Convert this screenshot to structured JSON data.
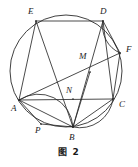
{
  "figure": {
    "caption": "图 2",
    "stroke_color": "#2b2b2b",
    "label_color": "#1c1c1c",
    "background_color": "#ffffff",
    "circle": {
      "cx": 66,
      "cy": 71,
      "r": 56
    },
    "points": [
      {
        "id": "E",
        "label": "E",
        "x": 36,
        "y": 21,
        "label_x": 28,
        "label_y": 7
      },
      {
        "id": "D",
        "label": "D",
        "x": 103,
        "y": 21,
        "label_x": 100,
        "label_y": 7
      },
      {
        "id": "F",
        "label": "F",
        "x": 120,
        "y": 53,
        "label_x": 126,
        "label_y": 45
      },
      {
        "id": "M",
        "label": "M",
        "x": 90,
        "y": 72,
        "label_x": 79,
        "label_y": 52
      },
      {
        "id": "C",
        "label": "C",
        "x": 113,
        "y": 99,
        "label_x": 119,
        "label_y": 100
      },
      {
        "id": "N",
        "label": "N",
        "x": 73,
        "y": 99,
        "label_x": 66,
        "label_y": 86
      },
      {
        "id": "A",
        "label": "A",
        "x": 19,
        "y": 100,
        "label_x": 11,
        "label_y": 104
      },
      {
        "id": "P",
        "label": "P",
        "x": 41,
        "y": 124,
        "label_x": 35,
        "label_y": 126
      },
      {
        "id": "B",
        "label": "B",
        "x": 73,
        "y": 127,
        "label_x": 69,
        "label_y": 133
      }
    ],
    "segments": [
      {
        "name": "segment-ED",
        "from": "E",
        "to": "D"
      },
      {
        "name": "segment-EA",
        "from": "E",
        "to": "A"
      },
      {
        "name": "segment-EB",
        "from": "E",
        "to": "B"
      },
      {
        "name": "segment-DB",
        "from": "D",
        "to": "B"
      },
      {
        "name": "segment-DC",
        "from": "D",
        "to": "C"
      },
      {
        "name": "segment-DF",
        "from": "D",
        "to": "F"
      },
      {
        "name": "segment-AF",
        "from": "A",
        "to": "F"
      },
      {
        "name": "segment-AC",
        "from": "A",
        "to": "C"
      },
      {
        "name": "segment-AB",
        "from": "A",
        "to": "B"
      },
      {
        "name": "segment-AP",
        "from": "A",
        "to": "P"
      },
      {
        "name": "segment-PB",
        "from": "P",
        "to": "B"
      },
      {
        "name": "segment-BC",
        "from": "B",
        "to": "C"
      },
      {
        "name": "segment-CF",
        "from": "C",
        "to": "F"
      },
      {
        "name": "segment-MB",
        "from": "M",
        "to": "B"
      }
    ],
    "arcs": [
      {
        "name": "arc-apb",
        "from": "A",
        "to": "B",
        "sweep": 1,
        "bulge": 1.15
      },
      {
        "name": "arc-bc",
        "from": "B",
        "to": "C",
        "sweep": 0,
        "bulge": 1.35
      },
      {
        "name": "arc-df",
        "from": "D",
        "to": "F",
        "sweep": 0,
        "bulge": 1.6
      }
    ]
  }
}
